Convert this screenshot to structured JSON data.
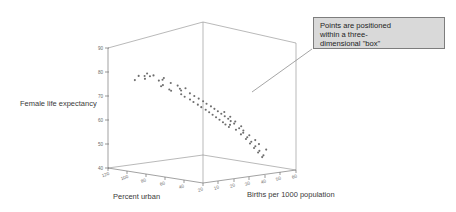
{
  "figure": {
    "background": "#ffffff",
    "line_color": "#8a8a8a",
    "point_color": "#6d6d6d",
    "callout": {
      "text": "Points are positioned\nwithin a three-\ndimensional \"box\"",
      "background": "#d9d9d9",
      "border_color": "#7d7d7d"
    }
  },
  "chart_data": {
    "type": "scatter",
    "title": "",
    "projection": "3d",
    "xlabel": "Births per 1000 population",
    "ylabel": "Female life expectancy",
    "zlabel": "Percent urban",
    "xlim": [
      10,
      70
    ],
    "ylim": [
      40,
      90
    ],
    "zlim": [
      120,
      20
    ],
    "grid": false,
    "legend": null,
    "xticks": [
      10,
      20,
      30,
      40,
      50,
      60,
      70
    ],
    "yticks": [
      40,
      50,
      60,
      70,
      80,
      90
    ],
    "zticks": [
      120,
      100,
      80,
      60,
      40,
      20
    ],
    "annotations": [
      {
        "text": "Points are positioned within a three-dimensional \"box\"",
        "target": "plot-box"
      }
    ],
    "points": [
      {
        "births": 13,
        "life": 79,
        "urban": 86
      },
      {
        "births": 14,
        "life": 80,
        "urban": 88
      },
      {
        "births": 12,
        "life": 80,
        "urban": 91
      },
      {
        "births": 13,
        "life": 81,
        "urban": 77
      },
      {
        "births": 15,
        "life": 80,
        "urban": 84
      },
      {
        "births": 14,
        "life": 79,
        "urban": 73
      },
      {
        "births": 12,
        "life": 78,
        "urban": 95
      },
      {
        "births": 16,
        "life": 80,
        "urban": 71
      },
      {
        "births": 15,
        "life": 81,
        "urban": 87
      },
      {
        "births": 13,
        "life": 77,
        "urban": 69
      },
      {
        "births": 17,
        "life": 79,
        "urban": 74
      },
      {
        "births": 14,
        "life": 76,
        "urban": 62
      },
      {
        "births": 18,
        "life": 78,
        "urban": 67
      },
      {
        "births": 16,
        "life": 77,
        "urban": 72
      },
      {
        "births": 19,
        "life": 76,
        "urban": 59
      },
      {
        "births": 17,
        "life": 75,
        "urban": 65
      },
      {
        "births": 20,
        "life": 77,
        "urban": 63
      },
      {
        "births": 18,
        "life": 74,
        "urban": 56
      },
      {
        "births": 21,
        "life": 75,
        "urban": 61
      },
      {
        "births": 19,
        "life": 73,
        "urban": 54
      },
      {
        "births": 22,
        "life": 76,
        "urban": 58
      },
      {
        "births": 20,
        "life": 72,
        "urban": 50
      },
      {
        "births": 23,
        "life": 74,
        "urban": 55
      },
      {
        "births": 21,
        "life": 71,
        "urban": 48
      },
      {
        "births": 24,
        "life": 73,
        "urban": 52
      },
      {
        "births": 22,
        "life": 70,
        "urban": 45
      },
      {
        "births": 25,
        "life": 72,
        "urban": 49
      },
      {
        "births": 23,
        "life": 69,
        "urban": 43
      },
      {
        "births": 26,
        "life": 71,
        "urban": 46
      },
      {
        "births": 24,
        "life": 68,
        "urban": 40
      },
      {
        "births": 27,
        "life": 70,
        "urban": 44
      },
      {
        "births": 25,
        "life": 67,
        "urban": 38
      },
      {
        "births": 28,
        "life": 69,
        "urban": 41
      },
      {
        "births": 26,
        "life": 66,
        "urban": 36
      },
      {
        "births": 29,
        "life": 68,
        "urban": 39
      },
      {
        "births": 27,
        "life": 65,
        "urban": 34
      },
      {
        "births": 30,
        "life": 67,
        "urban": 37
      },
      {
        "births": 28,
        "life": 64,
        "urban": 32
      },
      {
        "births": 31,
        "life": 66,
        "urban": 35
      },
      {
        "births": 29,
        "life": 63,
        "urban": 30
      },
      {
        "births": 32,
        "life": 65,
        "urban": 33
      },
      {
        "births": 30,
        "life": 62,
        "urban": 29
      },
      {
        "births": 33,
        "life": 64,
        "urban": 31
      },
      {
        "births": 31,
        "life": 61,
        "urban": 27
      },
      {
        "births": 34,
        "life": 63,
        "urban": 30
      },
      {
        "births": 35,
        "life": 62,
        "urban": 28
      },
      {
        "births": 36,
        "life": 61,
        "urban": 34
      },
      {
        "births": 37,
        "life": 60,
        "urban": 26
      },
      {
        "births": 38,
        "life": 59,
        "urban": 31
      },
      {
        "births": 39,
        "life": 58,
        "urban": 25
      },
      {
        "births": 40,
        "life": 57,
        "urban": 29
      },
      {
        "births": 41,
        "life": 56,
        "urban": 24
      },
      {
        "births": 42,
        "life": 55,
        "urban": 27
      },
      {
        "births": 43,
        "life": 54,
        "urban": 23
      },
      {
        "births": 44,
        "life": 53,
        "urban": 26
      },
      {
        "births": 45,
        "life": 52,
        "urban": 22
      },
      {
        "births": 46,
        "life": 51,
        "urban": 25
      },
      {
        "births": 47,
        "life": 50,
        "urban": 21
      },
      {
        "births": 48,
        "life": 49,
        "urban": 24
      },
      {
        "births": 49,
        "life": 48,
        "urban": 20
      },
      {
        "births": 50,
        "life": 47,
        "urban": 23
      },
      {
        "births": 51,
        "life": 52,
        "urban": 28
      },
      {
        "births": 52,
        "life": 50,
        "urban": 22
      },
      {
        "births": 44,
        "life": 58,
        "urban": 33
      },
      {
        "births": 46,
        "life": 56,
        "urban": 30
      },
      {
        "births": 48,
        "life": 54,
        "urban": 27
      },
      {
        "births": 36,
        "life": 66,
        "urban": 40
      },
      {
        "births": 38,
        "life": 64,
        "urban": 37
      },
      {
        "births": 40,
        "life": 62,
        "urban": 35
      },
      {
        "births": 42,
        "life": 60,
        "urban": 32
      }
    ]
  },
  "labels": {
    "y_axis_title": "Female life expectancy",
    "z_axis_title": "Percent urban",
    "x_axis_title": "Births per 1000 population"
  }
}
